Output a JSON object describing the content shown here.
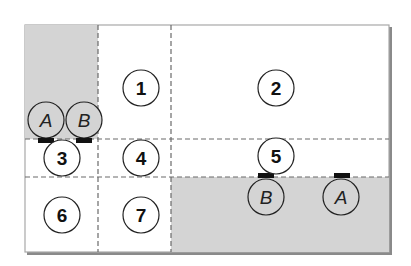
{
  "diagram": {
    "outer_box": {
      "x": 25,
      "y": 25,
      "w": 364,
      "h": 227
    },
    "colors": {
      "background": "#ffffff",
      "shaded": "#d4d4d4",
      "border": "#a8a8a8",
      "shadow": "#8a8a8a",
      "dash": "#6a6a6a",
      "circle_stroke": "#222222",
      "tab": "#111111"
    },
    "shaded_regions": [
      {
        "name": "top-left-shaded",
        "x": 25,
        "y": 25,
        "w": 73,
        "h": 114
      },
      {
        "name": "bottom-right-shaded",
        "x": 171,
        "y": 177,
        "w": 218,
        "h": 75
      }
    ],
    "grid_lines": {
      "vertical": [
        98,
        171
      ],
      "horizontal": [
        139,
        177
      ]
    },
    "numbered_cells": [
      {
        "label": "1",
        "cx": 141,
        "cy": 88
      },
      {
        "label": "2",
        "cx": 276,
        "cy": 88
      },
      {
        "label": "3",
        "cx": 62,
        "cy": 158
      },
      {
        "label": "4",
        "cx": 141,
        "cy": 158
      },
      {
        "label": "5",
        "cx": 276,
        "cy": 156
      },
      {
        "label": "6",
        "cx": 62,
        "cy": 215
      },
      {
        "label": "7",
        "cx": 141,
        "cy": 215
      }
    ],
    "lettered_markers": [
      {
        "label": "A",
        "cx": 46,
        "cy": 120,
        "group": "top-left"
      },
      {
        "label": "B",
        "cx": 84,
        "cy": 120,
        "group": "top-left"
      },
      {
        "label": "B",
        "cx": 266,
        "cy": 197,
        "group": "bottom-right"
      },
      {
        "label": "A",
        "cx": 341,
        "cy": 197,
        "group": "bottom-right"
      }
    ],
    "tabs": [
      {
        "x": 38,
        "y": 138,
        "w": 16,
        "h": 5
      },
      {
        "x": 76,
        "y": 138,
        "w": 16,
        "h": 5
      },
      {
        "x": 258,
        "y": 173,
        "w": 16,
        "h": 5
      },
      {
        "x": 334,
        "y": 173,
        "w": 16,
        "h": 5
      }
    ]
  }
}
